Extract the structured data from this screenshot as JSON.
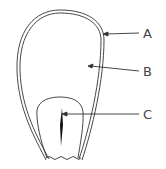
{
  "diagram": {
    "labels": [
      {
        "id": "A",
        "text": "A",
        "points_to": "outer coat"
      },
      {
        "id": "B",
        "text": "B",
        "points_to": "inner body"
      },
      {
        "id": "C",
        "text": "C",
        "points_to": "embryo slit"
      }
    ],
    "colors": {
      "stroke": "#333333",
      "label": "#444444",
      "background": "#ffffff"
    }
  }
}
